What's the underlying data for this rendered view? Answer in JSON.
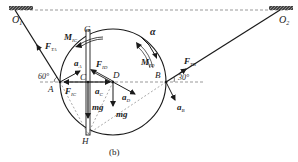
{
  "figure": {
    "caption": "(b)",
    "points": {
      "O1": "O",
      "O1_sub": "1",
      "O2": "O",
      "O2_sub": "2",
      "A": "A",
      "B": "B",
      "C": "C",
      "D": "D",
      "G": "G",
      "H": "H"
    },
    "forces": {
      "FTA": "F",
      "FTA_sub": "TA",
      "FTB": "F",
      "FTB_sub": "TB",
      "FID": "F",
      "FID_sub": "ID",
      "FIC": "F",
      "FIC_sub": "IC",
      "MIC": "M",
      "MIC_sub": "IC",
      "MID": "M",
      "MID_sub": "ID",
      "mg1": "mg",
      "mg2": "mg"
    },
    "accelerations": {
      "aA": "a",
      "aA_sub": "A",
      "aB": "a",
      "aB_sub": "B",
      "aC": "a",
      "aC_sub": "C",
      "aD": "a",
      "aD_sub": "D",
      "alpha": "α"
    },
    "angles": {
      "left": "60°",
      "right": "30°"
    }
  }
}
